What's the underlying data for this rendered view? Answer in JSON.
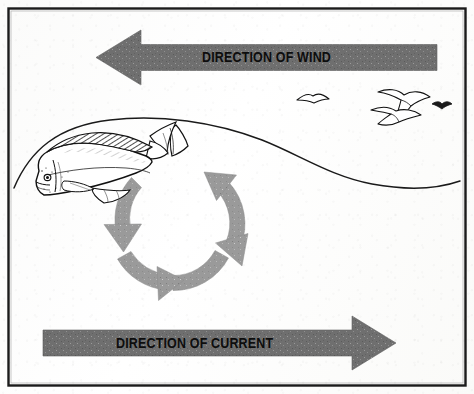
{
  "figure": {
    "frame": {
      "border_color": "#1b1b1b",
      "background": "#fdfdfc"
    }
  },
  "arrows": {
    "wind": {
      "label": "DIRECTION OF WIND",
      "direction": "left",
      "fill": "#6f6f6f",
      "text_color": "#111111"
    },
    "current": {
      "label": "DIRECTION OF CURRENT",
      "direction": "right",
      "fill": "#6f6f6f",
      "text_color": "#111111"
    },
    "circulation": {
      "name": "circular-current-eddy",
      "direction": "clockwise",
      "segments": 4,
      "fill": "#9a9a9a"
    }
  },
  "scene": {
    "wave_line": {
      "name": "surface-water-line",
      "stroke": "#1a1a1a"
    },
    "fish": {
      "name": "dolphinfish-mahi-mahi",
      "stroke": "#111111",
      "fill": "#ffffff"
    },
    "birds": [
      {
        "name": "seabird-small-left"
      },
      {
        "name": "seabird-large-upper-right"
      },
      {
        "name": "seabird-large-lower-right"
      },
      {
        "name": "seabird-distant-right"
      }
    ]
  }
}
